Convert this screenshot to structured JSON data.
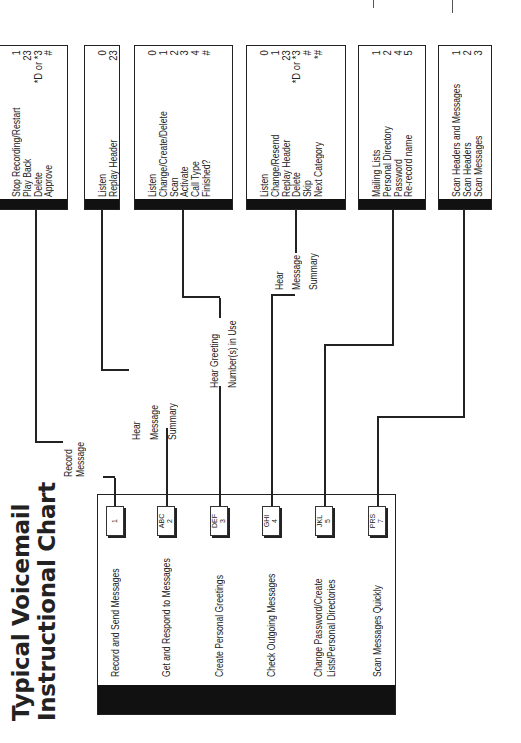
{
  "title": {
    "line1": "Typical Voicemail",
    "line2": "Instructional Chart"
  },
  "main_menu": [
    {
      "label": "Record and Send Messages",
      "key_letters": "",
      "key_number": "1"
    },
    {
      "label": "Get and Respond to Messages",
      "key_letters": "ABC",
      "key_number": "2"
    },
    {
      "label": "Create Personal Greetings",
      "key_letters": "DEF",
      "key_number": "3"
    },
    {
      "label": "Check Outgoing Messages",
      "key_letters": "GHI",
      "key_number": "4"
    },
    {
      "label_line1": "Change Password/Create",
      "label_line2": "Lists/Personal Directories",
      "key_letters": "JKL",
      "key_number": "5"
    },
    {
      "label": "Scan Messages Quickly",
      "key_letters": "PRS",
      "key_number": "7"
    }
  ],
  "connectors": {
    "record": {
      "line1": "Record",
      "line2": "Message"
    },
    "get": {
      "line1": "Hear",
      "line2": "Message",
      "line3": "Summary"
    },
    "greetings": {
      "line1": "Hear Greeting",
      "line2": "Number(s) in Use"
    },
    "outgoing": {
      "line1": "Hear",
      "line2": "Message",
      "line3": "Summary"
    }
  },
  "option_boxes": [
    {
      "items": [
        {
          "label": "Stop Recording/Restart",
          "key": "1"
        },
        {
          "label": "Play Back",
          "key": "23"
        },
        {
          "label": "Delete",
          "key": "*D or *3"
        },
        {
          "label": "Approve",
          "key": "#"
        }
      ]
    },
    {
      "items": [
        {
          "label": "Listen",
          "key": "0"
        },
        {
          "label": "Replay Header",
          "key": "23"
        }
      ]
    },
    {
      "items": [
        {
          "label": "Listen",
          "key": "0"
        },
        {
          "label": "Change/Create/Delete",
          "key": "1"
        },
        {
          "label": "Scan",
          "key": "2"
        },
        {
          "label": "Activate",
          "key": "3"
        },
        {
          "label": "Call Type",
          "key": "4"
        },
        {
          "label": "Finished?",
          "key": "#"
        }
      ]
    },
    {
      "items": [
        {
          "label": "Listen",
          "key": "0"
        },
        {
          "label": "Change/Resend",
          "key": "1"
        },
        {
          "label": "Replay Header",
          "key": "23"
        },
        {
          "label": "Delete",
          "key": "*D or *3"
        },
        {
          "label": "Skip",
          "key": "#"
        },
        {
          "label": "Next Category",
          "key": "*#"
        }
      ]
    },
    {
      "items": [
        {
          "label": "Mailing Lists",
          "key": "1"
        },
        {
          "label": "Personal Directory",
          "key": "2"
        },
        {
          "label": "Password",
          "key": "4"
        },
        {
          "label": "Re-record name",
          "key": "5"
        }
      ]
    },
    {
      "items": [
        {
          "label": "Scan Headers and Messages",
          "key": "1"
        },
        {
          "label": "Scan Headers",
          "key": "2"
        },
        {
          "label": "Scan Messages",
          "key": "3"
        }
      ]
    }
  ]
}
